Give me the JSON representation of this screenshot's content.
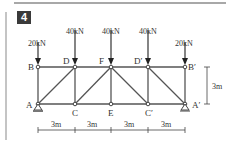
{
  "problem": {
    "number": "4"
  },
  "loads": [
    {
      "node": "B",
      "label": "20kN"
    },
    {
      "node": "D",
      "label": "40kN"
    },
    {
      "node": "F",
      "label": "40kN"
    },
    {
      "node": "D'",
      "label": "40kN"
    },
    {
      "node": "B'",
      "label": "20kN"
    }
  ],
  "nodes": {
    "A": "A",
    "B": "B",
    "C": "C",
    "D": "D",
    "E": "E",
    "F": "F",
    "Cp": "C′",
    "Dp": "D′",
    "Bp": "B′",
    "Ap": "A′"
  },
  "dimensions": {
    "spans": [
      "3m",
      "3m",
      "3m",
      "3m"
    ],
    "height": "3m"
  },
  "colors": {
    "member": "#555555",
    "text": "#333333",
    "box": "#3a3a3a",
    "rule": "#a8a8a8"
  }
}
